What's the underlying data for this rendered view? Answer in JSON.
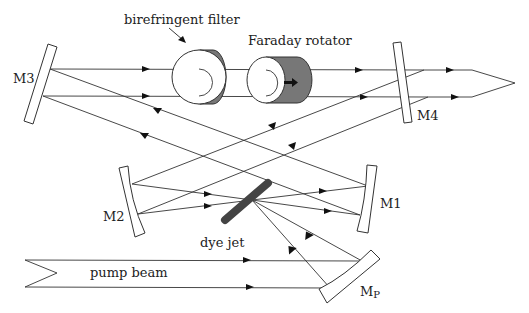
{
  "diagram": {
    "labels": {
      "birefringent_filter": "birefringent filter",
      "faraday_rotator": "Faraday rotator",
      "m1": "M1",
      "m2": "M2",
      "m3": "M3",
      "m4": "M4",
      "mp": "M",
      "mp_sub": "P",
      "dye_jet": "dye jet",
      "pump_beam": "pump beam"
    },
    "components": [
      {
        "id": "M1",
        "type": "curved mirror"
      },
      {
        "id": "M2",
        "type": "curved mirror"
      },
      {
        "id": "M3",
        "type": "flat mirror"
      },
      {
        "id": "M4",
        "type": "output coupler"
      },
      {
        "id": "Mp",
        "type": "pump focusing mirror"
      },
      {
        "id": "birefringent-filter",
        "type": "tuning element"
      },
      {
        "id": "faraday-rotator",
        "type": "optical diode"
      },
      {
        "id": "dye-jet",
        "type": "gain medium"
      }
    ],
    "colors": {
      "line": "#333333",
      "component_fill": "#777777",
      "dye_jet": "#444444",
      "background": "#ffffff"
    }
  }
}
